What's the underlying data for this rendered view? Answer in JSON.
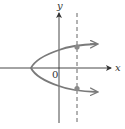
{
  "diagram": {
    "type": "graph-sketch",
    "axes": {
      "x_label": "x",
      "y_label": "y",
      "origin_label": "0"
    },
    "curve": {
      "kind": "parabola-opening-right",
      "color": "#7a7a7a",
      "vertex_px": [
        31,
        68
      ]
    },
    "vertical_line": {
      "style": "dashed",
      "x_px": 77
    },
    "intersection_points": [
      {
        "x_px": 77,
        "y_px": 47
      },
      {
        "x_px": 77,
        "y_px": 88
      }
    ],
    "colors": {
      "axis": "#333333",
      "curve": "#7a7a7a",
      "dashed_line": "#555555",
      "point": "#8a8a8a"
    }
  }
}
